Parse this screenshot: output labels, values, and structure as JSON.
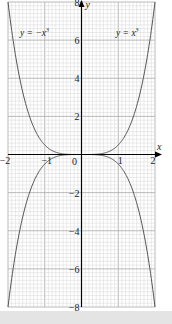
{
  "chart_data": {
    "type": "line",
    "title": "",
    "xlabel": "x",
    "ylabel": "y",
    "xlim": [
      -2,
      2
    ],
    "ylim": [
      -8,
      8
    ],
    "grid": true,
    "x_ticks": [
      -2,
      -1,
      0,
      1,
      2
    ],
    "x_tick_labels": [
      "-2",
      "-1",
      "0",
      "1",
      "2"
    ],
    "y_ticks": [
      -8,
      -6,
      -4,
      -2,
      2,
      4,
      6,
      8
    ],
    "y_tick_labels": [
      "-8",
      "-6",
      "-4",
      "-2",
      "2",
      "4",
      "6",
      "8"
    ],
    "series": [
      {
        "name": "y = x^3... (upper, shown as y = x^3 label)",
        "label": "y = x³",
        "formula": "x^3",
        "x": [
          -2,
          -1.5,
          -1,
          -0.5,
          0,
          0.5,
          1,
          1.5,
          2
        ],
        "values": [
          8,
          3.375,
          1,
          0.125,
          0,
          0.125,
          1,
          3.375,
          8
        ]
      },
      {
        "name": "y = -x^3 (lower)",
        "label": "y = −x³",
        "formula": "-x^3",
        "x": [
          -2,
          -1.5,
          -1,
          -0.5,
          0,
          0.5,
          1,
          1.5,
          2
        ],
        "values": [
          -8,
          -3.375,
          -1,
          -0.125,
          0,
          -0.125,
          -1,
          -3.375,
          -8
        ]
      }
    ],
    "annotations": [
      {
        "text": "y = −x³",
        "position": "upper-left"
      },
      {
        "text": "y = x³",
        "position": "upper-right"
      }
    ],
    "legend": "none"
  },
  "labels": {
    "x_axis": "x",
    "y_axis": "y",
    "origin": "0",
    "curve_left": "y = −x",
    "curve_left_exp": "3",
    "curve_right": "y = x",
    "curve_right_exp": "3"
  },
  "colors": {
    "grid_minor": "#d6d6d6",
    "grid_major": "#a8a8a8",
    "axis": "#000000",
    "curve": "#555555",
    "band": "#e4e4e4"
  }
}
